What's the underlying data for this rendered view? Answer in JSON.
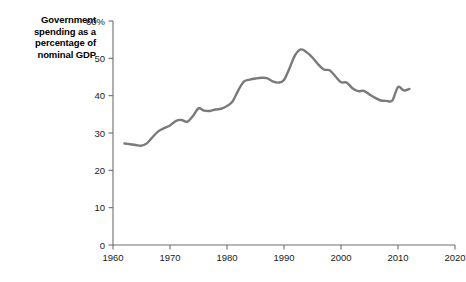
{
  "title": {
    "line1": "Government",
    "line2": "spending as a",
    "line3": "percentage of",
    "line4": "nominal GDP",
    "full": "Government spending as a percentage of nominal GDP"
  },
  "colors": {
    "line": "#7a7a7a",
    "axis": "#6e6e6e",
    "text": "#1a1a1a",
    "background": "#ffffff"
  },
  "axes": {
    "y_ticks": [
      "0",
      "10",
      "20",
      "30",
      "40",
      "50",
      "60%"
    ],
    "y_tick_values": [
      0,
      10,
      20,
      30,
      40,
      50,
      60
    ],
    "x_ticks": [
      "1960",
      "1970",
      "1980",
      "1990",
      "2000",
      "2010",
      "2020"
    ],
    "x_tick_values": [
      1960,
      1970,
      1980,
      1990,
      2000,
      2010,
      2020
    ]
  },
  "chart_data": {
    "type": "line",
    "title": "Government spending as a percentage of nominal GDP",
    "xlabel": "",
    "ylabel": "",
    "xlim": [
      1960,
      2020
    ],
    "ylim": [
      0,
      60
    ],
    "grid": false,
    "legend": false,
    "y_unit": "%",
    "series": [
      {
        "name": "Government spending as a percentage of nominal GDP",
        "color": "#7a7a7a",
        "x": [
          1962,
          1963,
          1964,
          1965,
          1966,
          1967,
          1968,
          1969,
          1970,
          1971,
          1972,
          1973,
          1974,
          1975,
          1976,
          1977,
          1978,
          1979,
          1980,
          1981,
          1982,
          1983,
          1984,
          1985,
          1986,
          1987,
          1988,
          1989,
          1990,
          1991,
          1992,
          1993,
          1994,
          1995,
          1996,
          1997,
          1998,
          1999,
          2000,
          2001,
          2002,
          2003,
          2004,
          2005,
          2006,
          2007,
          2008,
          2009,
          2010,
          2011,
          2012
        ],
        "values": [
          27.2,
          27.0,
          26.8,
          26.6,
          27.3,
          29.0,
          30.5,
          31.3,
          32.0,
          33.2,
          33.5,
          33.0,
          34.5,
          36.6,
          36.0,
          35.9,
          36.3,
          36.5,
          37.2,
          38.5,
          41.5,
          43.8,
          44.3,
          44.6,
          44.8,
          44.7,
          43.8,
          43.5,
          44.2,
          47.5,
          51.0,
          52.4,
          51.6,
          50.2,
          48.4,
          47.0,
          46.8,
          45.2,
          43.6,
          43.5,
          42.0,
          41.2,
          41.3,
          40.3,
          39.4,
          38.7,
          38.6,
          38.7,
          42.3,
          41.4,
          41.8
        ]
      }
    ]
  }
}
